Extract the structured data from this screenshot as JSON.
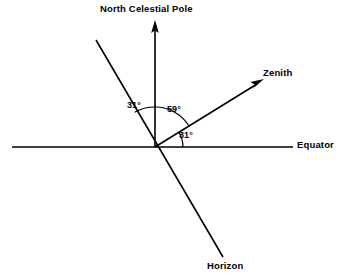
{
  "figure": {
    "type": "celestial-sphere-angle-diagram",
    "background_color": "#ffffff",
    "stroke_color": "#000000",
    "text_color": "#000000"
  },
  "labels": {
    "north_celestial_pole": "North Celestial Pole",
    "zenith": "Zenith",
    "equator": "Equator",
    "horizon": "Horizon"
  },
  "angles": {
    "ncp_to_horizon": "31°",
    "ncp_to_zenith": "59°",
    "zenith_to_equator": "31°"
  },
  "geometry": {
    "vertex_x": 155,
    "vertex_y": 147,
    "equator_left_x": 12,
    "equator_right_x": 293,
    "ncp_tip_x": 155,
    "ncp_tip_y": 22,
    "zenith_tip_x": 263,
    "zenith_tip_y": 79,
    "horizon_upper_x": 96,
    "horizon_upper_y": 40,
    "horizon_lower_x": 223,
    "horizon_lower_y": 257
  }
}
